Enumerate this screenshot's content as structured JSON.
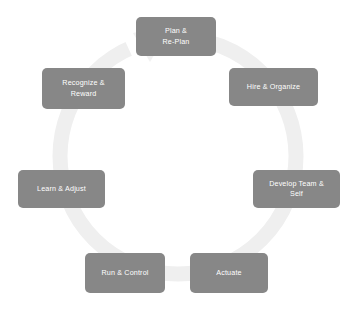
{
  "diagram": {
    "type": "cycle",
    "title": "",
    "background_color": "#ffffff",
    "node_fill_color": "#878787",
    "node_text_color": "#ffffff",
    "ring_color": "#efefef",
    "direction": "clockwise",
    "node_count": 7,
    "nodes": [
      {
        "id": "plan",
        "label": "Plan &\nRe-Plan",
        "order": 1
      },
      {
        "id": "hire",
        "label": "Hire & Organize",
        "order": 2
      },
      {
        "id": "develop",
        "label": "Develop Team &\nSelf",
        "order": 3
      },
      {
        "id": "actuate",
        "label": "Actuate",
        "order": 4
      },
      {
        "id": "run",
        "label": "Run & Control",
        "order": 5
      },
      {
        "id": "learn",
        "label": "Learn & Adjust",
        "order": 6
      },
      {
        "id": "recognize",
        "label": "Recognize &\nReward",
        "order": 7
      }
    ]
  }
}
